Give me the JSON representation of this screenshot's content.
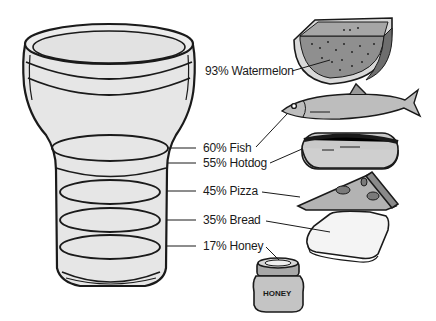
{
  "figure": {
    "colors": {
      "outline": "#1a1a1a",
      "glass_fill": "#e6e6e6",
      "food_fill": "#c8c8c8",
      "dark_fill": "#8a8a8a",
      "background": "#ffffff"
    },
    "items": [
      {
        "percent": "93%",
        "name": "Watermelon",
        "label": "93% Watermelon",
        "icon": "watermelon-icon"
      },
      {
        "percent": "60%",
        "name": "Fish",
        "label": "60% Fish",
        "icon": "fish-icon"
      },
      {
        "percent": "55%",
        "name": "Hotdog",
        "label": "55% Hotdog",
        "icon": "hotdog-icon"
      },
      {
        "percent": "45%",
        "name": "Pizza",
        "label": "45% Pizza",
        "icon": "pizza-slice-icon"
      },
      {
        "percent": "35%",
        "name": "Bread",
        "label": "35% Bread",
        "icon": "bread-slice-icon"
      },
      {
        "percent": "17%",
        "name": "Honey",
        "label": "17% Honey",
        "icon": "honey-jar-icon"
      }
    ],
    "jar_text": "HONEY"
  }
}
